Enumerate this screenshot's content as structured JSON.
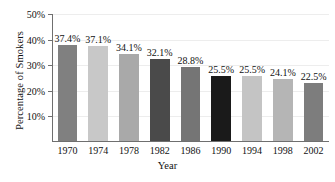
{
  "chart_data": {
    "type": "bar",
    "title": "",
    "xlabel": "Year",
    "ylabel": "Percentage of Smokers",
    "categories": [
      "1970",
      "1974",
      "1978",
      "1982",
      "1986",
      "1990",
      "1994",
      "1998",
      "2002"
    ],
    "values": [
      37.4,
      37.1,
      34.1,
      32.1,
      28.8,
      25.5,
      25.5,
      24.1,
      22.5
    ],
    "value_labels": [
      "37.4%",
      "37.1%",
      "34.1%",
      "32.1%",
      "28.8%",
      "25.5%",
      "25.5%",
      "24.1%",
      "22.5%"
    ],
    "bar_colors": [
      "#808080",
      "#c8c8c8",
      "#a9a9a9",
      "#4a4a4a",
      "#757575",
      "#1a1a1a",
      "#c4c4c4",
      "#b5b5b5",
      "#7d7d7d"
    ],
    "ylim": [
      0,
      50
    ],
    "ytick_values": [
      10,
      20,
      30,
      40,
      50
    ],
    "ytick_labels": [
      "10%",
      "20%",
      "30%",
      "40%",
      "50%"
    ],
    "grid": true,
    "grid_color": "#ededed",
    "axis_color": "#6f6f6f",
    "legend": "none",
    "background": "#ffffff"
  }
}
